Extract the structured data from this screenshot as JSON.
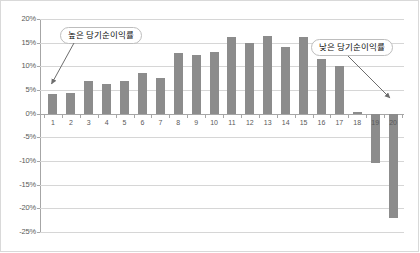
{
  "chart_data": {
    "type": "bar",
    "title": "",
    "xlabel": "",
    "ylabel": "",
    "ylim": [
      -25,
      20
    ],
    "grid": true,
    "legend": "none",
    "categories": [
      "1",
      "2",
      "3",
      "4",
      "5",
      "6",
      "7",
      "8",
      "9",
      "10",
      "11",
      "12",
      "13",
      "14",
      "15",
      "16",
      "17",
      "18",
      "19",
      "20"
    ],
    "values": [
      4.1,
      4.4,
      6.8,
      6.3,
      6.8,
      8.5,
      7.5,
      12.8,
      12.4,
      13.0,
      16.1,
      15.0,
      16.5,
      14.0,
      16.1,
      11.5,
      10.0,
      0.3,
      -10.5,
      -22.0
    ],
    "ytick_labels": [
      "20%",
      "15%",
      "10%",
      "5%",
      "0%",
      "-5%",
      "-10%",
      "-15%",
      "-20%",
      "-25%"
    ],
    "ytick_values": [
      20,
      15,
      10,
      5,
      0,
      -5,
      -10,
      -15,
      -20,
      -25
    ],
    "series_color": "#8c8c8c",
    "gridline_color": "#d6d6d6",
    "axis_color": "#a6a6a6",
    "annotations": [
      {
        "label": "높은 당기순이익률",
        "points_to_category": "1",
        "points_to_value": 4.1
      },
      {
        "label": "낮은 당기순이익률",
        "points_to_category": "20",
        "points_to_value": -22.0
      }
    ]
  }
}
